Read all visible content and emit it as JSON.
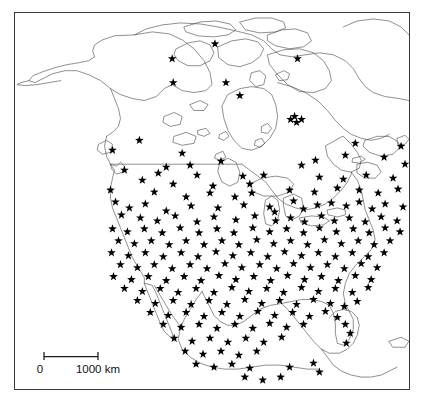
{
  "figure": {
    "type": "distribution-map",
    "region": "North America",
    "marker_symbol": "star",
    "marker_color": "#000000",
    "coastline_color": "#4a4a4a",
    "background_color": "#ffffff",
    "frame": {
      "x": 14,
      "y": 12,
      "width": 396,
      "height": 378
    }
  },
  "scalebar": {
    "left_label": "0",
    "right_label": "1000 km",
    "length_km": 1000,
    "length_px": 54,
    "tick_label_left": "0",
    "tick_label_right": "1000 km"
  },
  "chart_data": {
    "type": "scatter",
    "title": "",
    "xlabel": "",
    "ylabel": "",
    "projection": "north-america-outline",
    "marker": "star",
    "point_count": 212,
    "legend": [],
    "grid": false,
    "xlim": [
      0,
      396
    ],
    "ylim": [
      0,
      378
    ],
    "points": [
      [
        201,
        31
      ],
      [
        158,
        46
      ],
      [
        284,
        46
      ],
      [
        159,
        70
      ],
      [
        212,
        70
      ],
      [
        226,
        83
      ],
      [
        281,
        104
      ],
      [
        277,
        107
      ],
      [
        283,
        110
      ],
      [
        288,
        107
      ],
      [
        417,
        126
      ],
      [
        435,
        126
      ],
      [
        342,
        131
      ],
      [
        388,
        134
      ],
      [
        125,
        128
      ],
      [
        98,
        138
      ],
      [
        168,
        141
      ],
      [
        152,
        155
      ],
      [
        176,
        153
      ],
      [
        207,
        149
      ],
      [
        288,
        153
      ],
      [
        302,
        148
      ],
      [
        332,
        143
      ],
      [
        371,
        145
      ],
      [
        392,
        152
      ],
      [
        110,
        158
      ],
      [
        144,
        161
      ],
      [
        183,
        163
      ],
      [
        229,
        164
      ],
      [
        250,
        163
      ],
      [
        128,
        168
      ],
      [
        159,
        172
      ],
      [
        199,
        174
      ],
      [
        236,
        172
      ],
      [
        306,
        165
      ],
      [
        330,
        167
      ],
      [
        353,
        163
      ],
      [
        380,
        166
      ],
      [
        404,
        160
      ],
      [
        96,
        178
      ],
      [
        140,
        180
      ],
      [
        172,
        185
      ],
      [
        196,
        181
      ],
      [
        221,
        185
      ],
      [
        238,
        181
      ],
      [
        276,
        178
      ],
      [
        301,
        180
      ],
      [
        324,
        176
      ],
      [
        346,
        178
      ],
      [
        365,
        181
      ],
      [
        385,
        177
      ],
      [
        101,
        190
      ],
      [
        115,
        196
      ],
      [
        131,
        192
      ],
      [
        152,
        199
      ],
      [
        177,
        194
      ],
      [
        204,
        196
      ],
      [
        230,
        193
      ],
      [
        256,
        195
      ],
      [
        261,
        200
      ],
      [
        280,
        189
      ],
      [
        290,
        197
      ],
      [
        304,
        193
      ],
      [
        318,
        191
      ],
      [
        333,
        194
      ],
      [
        346,
        190
      ],
      [
        359,
        197
      ],
      [
        372,
        192
      ],
      [
        390,
        195
      ],
      [
        107,
        203
      ],
      [
        126,
        206
      ],
      [
        143,
        209
      ],
      [
        161,
        204
      ],
      [
        183,
        210
      ],
      [
        200,
        205
      ],
      [
        222,
        208
      ],
      [
        241,
        204
      ],
      [
        262,
        209
      ],
      [
        277,
        206
      ],
      [
        291,
        210
      ],
      [
        308,
        204
      ],
      [
        321,
        209
      ],
      [
        336,
        206
      ],
      [
        352,
        210
      ],
      [
        368,
        205
      ],
      [
        384,
        209
      ],
      [
        98,
        217
      ],
      [
        113,
        220
      ],
      [
        130,
        217
      ],
      [
        148,
        221
      ],
      [
        166,
        216
      ],
      [
        185,
        221
      ],
      [
        203,
        217
      ],
      [
        220,
        221
      ],
      [
        239,
        216
      ],
      [
        256,
        220
      ],
      [
        273,
        217
      ],
      [
        290,
        221
      ],
      [
        306,
        216
      ],
      [
        323,
        220
      ],
      [
        340,
        217
      ],
      [
        356,
        221
      ],
      [
        372,
        216
      ],
      [
        387,
        220
      ],
      [
        104,
        229
      ],
      [
        120,
        232
      ],
      [
        137,
        229
      ],
      [
        155,
        233
      ],
      [
        172,
        229
      ],
      [
        190,
        233
      ],
      [
        208,
        229
      ],
      [
        225,
        233
      ],
      [
        243,
        228
      ],
      [
        260,
        232
      ],
      [
        277,
        229
      ],
      [
        294,
        233
      ],
      [
        311,
        228
      ],
      [
        328,
        232
      ],
      [
        345,
        229
      ],
      [
        361,
        233
      ],
      [
        377,
        229
      ],
      [
        97,
        241
      ],
      [
        114,
        244
      ],
      [
        131,
        241
      ],
      [
        149,
        245
      ],
      [
        167,
        241
      ],
      [
        184,
        245
      ],
      [
        202,
        240
      ],
      [
        219,
        244
      ],
      [
        237,
        241
      ],
      [
        254,
        245
      ],
      [
        271,
        240
      ],
      [
        288,
        244
      ],
      [
        305,
        241
      ],
      [
        322,
        245
      ],
      [
        339,
        241
      ],
      [
        355,
        245
      ],
      [
        371,
        241
      ],
      [
        106,
        253
      ],
      [
        123,
        256
      ],
      [
        140,
        253
      ],
      [
        158,
        257
      ],
      [
        176,
        253
      ],
      [
        193,
        257
      ],
      [
        211,
        252
      ],
      [
        228,
        256
      ],
      [
        246,
        253
      ],
      [
        263,
        257
      ],
      [
        280,
        252
      ],
      [
        297,
        256
      ],
      [
        314,
        253
      ],
      [
        331,
        257
      ],
      [
        348,
        252
      ],
      [
        364,
        256
      ],
      [
        99,
        265
      ],
      [
        117,
        268
      ],
      [
        134,
        265
      ],
      [
        152,
        269
      ],
      [
        170,
        265
      ],
      [
        187,
        269
      ],
      [
        205,
        264
      ],
      [
        222,
        268
      ],
      [
        240,
        265
      ],
      [
        257,
        269
      ],
      [
        274,
        264
      ],
      [
        291,
        268
      ],
      [
        308,
        265
      ],
      [
        325,
        269
      ],
      [
        342,
        264
      ],
      [
        358,
        268
      ],
      [
        110,
        277
      ],
      [
        128,
        280
      ],
      [
        146,
        277
      ],
      [
        164,
        281
      ],
      [
        182,
        277
      ],
      [
        200,
        281
      ],
      [
        218,
        276
      ],
      [
        235,
        280
      ],
      [
        253,
        277
      ],
      [
        270,
        281
      ],
      [
        288,
        276
      ],
      [
        305,
        280
      ],
      [
        322,
        277
      ],
      [
        339,
        281
      ],
      [
        355,
        276
      ],
      [
        123,
        289
      ],
      [
        141,
        292
      ],
      [
        159,
        289
      ],
      [
        177,
        293
      ],
      [
        195,
        289
      ],
      [
        213,
        293
      ],
      [
        231,
        288
      ],
      [
        248,
        292
      ],
      [
        266,
        289
      ],
      [
        283,
        293
      ],
      [
        300,
        288
      ],
      [
        317,
        292
      ],
      [
        331,
        295
      ],
      [
        344,
        290
      ],
      [
        136,
        301
      ],
      [
        154,
        304
      ],
      [
        172,
        301
      ],
      [
        190,
        305
      ],
      [
        208,
        301
      ],
      [
        226,
        305
      ],
      [
        244,
        300
      ],
      [
        261,
        304
      ],
      [
        279,
        301
      ],
      [
        296,
        305
      ],
      [
        312,
        300
      ],
      [
        324,
        306
      ],
      [
        332,
        313
      ],
      [
        337,
        322
      ],
      [
        333,
        332
      ],
      [
        149,
        313
      ],
      [
        167,
        316
      ],
      [
        185,
        313
      ],
      [
        203,
        317
      ],
      [
        221,
        313
      ],
      [
        239,
        317
      ],
      [
        256,
        312
      ],
      [
        273,
        316
      ],
      [
        290,
        313
      ],
      [
        160,
        327
      ],
      [
        178,
        330
      ],
      [
        196,
        327
      ],
      [
        214,
        331
      ],
      [
        232,
        327
      ],
      [
        250,
        331
      ],
      [
        268,
        326
      ],
      [
        171,
        340
      ],
      [
        189,
        343
      ],
      [
        207,
        340
      ],
      [
        225,
        344
      ],
      [
        243,
        340
      ],
      [
        182,
        353
      ],
      [
        200,
        356
      ],
      [
        218,
        353
      ],
      [
        236,
        357
      ],
      [
        231,
        366
      ],
      [
        249,
        369
      ],
      [
        267,
        366
      ],
      [
        276,
        356
      ],
      [
        300,
        352
      ],
      [
        306,
        361
      ]
    ]
  },
  "annotations": {
    "alaska_label": "",
    "canada_label": "",
    "usa_label": "",
    "mexico_label": ""
  }
}
